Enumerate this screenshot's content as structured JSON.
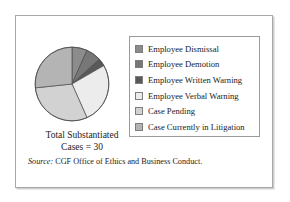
{
  "figure": {
    "caption_line1": "Total Substantiated",
    "caption_line2": "Cases = 30",
    "source_label": "Source:",
    "source_text": " CGF Office of Ethics and Business Conduct."
  },
  "legend": {
    "items": [
      {
        "label": "Employee Dismissal",
        "color": "#8c8c8c"
      },
      {
        "label": "Employee Demotion",
        "color": "#777777"
      },
      {
        "label": "Employee Written Warning",
        "color": "#595959"
      },
      {
        "label": "Employee Verbal Warning",
        "color": "#ececec"
      },
      {
        "label": "Case Pending",
        "color": "#d2d2d2"
      },
      {
        "label": "Case Currently in Litigation",
        "color": "#b4b4b4"
      }
    ]
  },
  "chart_data": {
    "type": "pie",
    "title": "Total Substantiated Cases = 30",
    "total": 30,
    "units": "cases",
    "start_angle_deg": -90,
    "direction": "clockwise",
    "stroke_color": "#4a4a4a",
    "categories": [
      "Employee Dismissal",
      "Employee Demotion",
      "Employee Written Warning",
      "Employee Verbal Warning",
      "Case Pending",
      "Case Currently in Litigation"
    ],
    "values": [
      2,
      2,
      1,
      8,
      9,
      8
    ],
    "percents": [
      6.7,
      6.7,
      3.3,
      26.7,
      30.0,
      26.7
    ],
    "colors": [
      "#8c8c8c",
      "#777777",
      "#595959",
      "#ececec",
      "#d2d2d2",
      "#b4b4b4"
    ],
    "legend_position": "right",
    "grid": false
  }
}
